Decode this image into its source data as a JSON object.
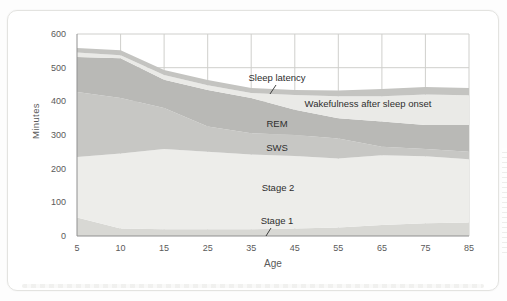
{
  "figure": {
    "y_axis_title": "Minutes",
    "x_axis_title": "Age"
  },
  "chart_data": {
    "type": "area",
    "stacked": true,
    "title": "",
    "xlabel": "Age",
    "ylabel": "Minutes",
    "x_tick_labels": [
      "5",
      "10",
      "15",
      "25",
      "35",
      "45",
      "55",
      "65",
      "75",
      "85"
    ],
    "y_ticks": [
      0,
      100,
      200,
      300,
      400,
      500,
      600
    ],
    "ylim": [
      0,
      600
    ],
    "grid": true,
    "legend_position": "none",
    "series": [
      {
        "name": "Stage 1",
        "color": "#d8d8d4",
        "values": [
          55,
          22,
          20,
          20,
          20,
          22,
          25,
          33,
          38,
          40
        ]
      },
      {
        "name": "Stage 2",
        "color": "#ededea",
        "values": [
          180,
          223,
          238,
          230,
          222,
          216,
          205,
          207,
          199,
          188
        ]
      },
      {
        "name": "SWS",
        "color": "#c7c7c4",
        "values": [
          193,
          165,
          122,
          75,
          63,
          62,
          60,
          25,
          21,
          22
        ]
      },
      {
        "name": "REM",
        "color": "#b9b9b6",
        "values": [
          104,
          118,
          84,
          109,
          105,
          75,
          60,
          75,
          72,
          80
        ]
      },
      {
        "name": "Wakefulness after sleep onset",
        "color": "#eaeae7",
        "values": [
          13,
          9,
          14,
          14,
          15,
          44,
          65,
          75,
          90,
          88
        ]
      },
      {
        "name": "Sleep latency",
        "color": "#c4c4c1",
        "values": [
          13,
          15,
          15,
          15,
          15,
          15,
          17,
          22,
          23,
          22
        ]
      }
    ],
    "annotations": [
      {
        "label": "Sleep latency",
        "x": 277,
        "y": 81,
        "leader": {
          "x1": 276,
          "y1": 85,
          "x2": 270,
          "y2": 94
        }
      },
      {
        "label": "Wakefulness after sleep onset",
        "x": 368,
        "y": 107
      },
      {
        "label": "REM",
        "x": 277,
        "y": 127
      },
      {
        "label": "SWS",
        "x": 277,
        "y": 151
      },
      {
        "label": "Stage 2",
        "x": 278,
        "y": 191
      },
      {
        "label": "Stage 1",
        "x": 277,
        "y": 224,
        "leader": {
          "x1": 271,
          "y1": 228,
          "x2": 266,
          "y2": 236
        }
      }
    ],
    "axis_color": "#909090",
    "grid_color": "#cfcfcc",
    "tick_label_color": "#5a5a5a",
    "annotation_color": "#2e2e2e"
  }
}
